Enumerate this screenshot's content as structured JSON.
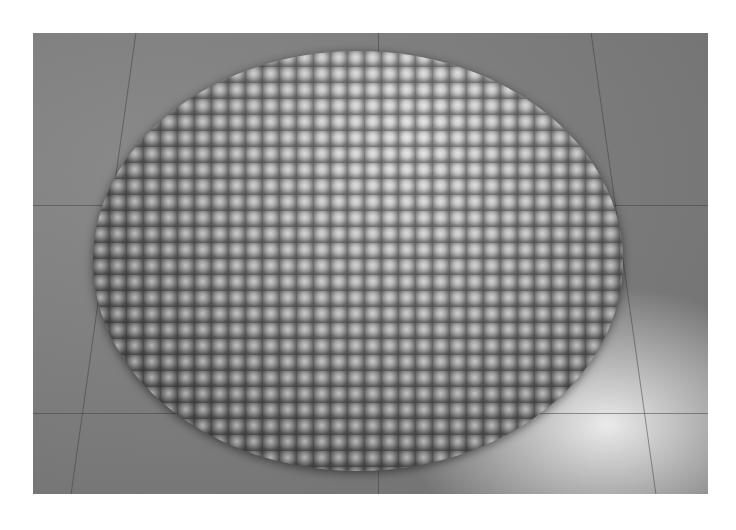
{
  "image": {
    "description": "Black-and-white photograph of a large circular arrangement of hundreds of rounded clay pots laid on a speckled terrazzo floor",
    "subject": "circular installation of clay pots",
    "floor": "speckled terrazzo tiles with grid lines",
    "color_mode": "grayscale",
    "palette": {
      "background": "#ffffff",
      "floor": "#7a7a7a",
      "pots_light": "#d8d8d8",
      "pots_dark": "#4a4a4a"
    }
  }
}
